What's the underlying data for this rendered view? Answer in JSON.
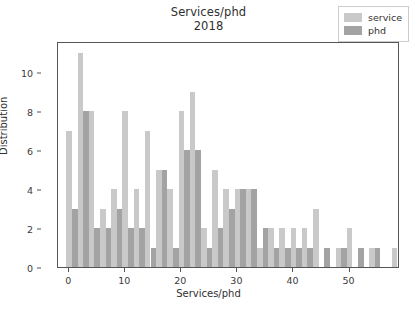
{
  "chart_data": {
    "type": "bar",
    "title": "Services/phd",
    "subtitle": "2018",
    "xlabel": "Services/phd",
    "ylabel": "Distribution",
    "xlim": [
      -2,
      59
    ],
    "ylim": [
      0,
      11.6
    ],
    "grid": false,
    "legend_position": "upper right",
    "xticks": [
      0,
      10,
      20,
      30,
      40,
      50
    ],
    "yticks": [
      0,
      2,
      4,
      6,
      8,
      10
    ],
    "colors": {
      "service": "#c9c9c9",
      "phd": "#a3a3a3",
      "axis": "#555555",
      "text": "#2f2f2f",
      "background": "#ffffff"
    },
    "series": [
      {
        "name": "service",
        "color": "#c9c9c9",
        "x": [
          0,
          2,
          4,
          6,
          9,
          11,
          13,
          15,
          17,
          19,
          21,
          23,
          25,
          27,
          29,
          31,
          33,
          35,
          37,
          39,
          41,
          44,
          47,
          50,
          52,
          56
        ],
        "values": [
          7,
          11,
          8,
          3,
          8,
          4,
          7,
          1,
          5,
          9,
          5,
          5,
          4,
          4,
          2,
          2,
          2,
          3,
          2,
          1,
          1,
          2,
          1,
          1,
          1,
          1
        ]
      },
      {
        "name": "phd",
        "color": "#a3a3a3",
        "x": [
          1,
          3,
          5,
          7,
          10,
          12,
          14,
          16,
          18,
          20,
          22,
          24,
          26,
          28,
          30,
          32,
          34,
          36,
          38,
          41,
          45,
          48,
          51,
          53
        ],
        "values": [
          3,
          2,
          2,
          3,
          2,
          1,
          1,
          5,
          6,
          2,
          2,
          3,
          4,
          4,
          1,
          1,
          1,
          1,
          1,
          1,
          1,
          1,
          1,
          1
        ]
      }
    ],
    "bars": [
      {
        "series": "service",
        "x": 0,
        "value": 7
      },
      {
        "series": "phd",
        "x": 1,
        "value": 3
      },
      {
        "series": "service",
        "x": 2,
        "value": 11
      },
      {
        "series": "phd",
        "x": 3,
        "value": 8
      },
      {
        "series": "service",
        "x": 4,
        "value": 8
      },
      {
        "series": "phd",
        "x": 5,
        "value": 2
      },
      {
        "series": "service",
        "x": 6,
        "value": 3
      },
      {
        "series": "phd",
        "x": 7,
        "value": 2
      },
      {
        "series": "service",
        "x": 8,
        "value": 4
      },
      {
        "series": "phd",
        "x": 9,
        "value": 3
      },
      {
        "series": "service",
        "x": 10,
        "value": 8
      },
      {
        "series": "phd",
        "x": 11,
        "value": 2
      },
      {
        "series": "service",
        "x": 12,
        "value": 4
      },
      {
        "series": "phd",
        "x": 13,
        "value": 2
      },
      {
        "series": "service",
        "x": 14,
        "value": 7
      },
      {
        "series": "phd",
        "x": 15,
        "value": 1
      },
      {
        "series": "service",
        "x": 16,
        "value": 5
      },
      {
        "series": "phd",
        "x": 17,
        "value": 5
      },
      {
        "series": "service",
        "x": 18,
        "value": 4
      },
      {
        "series": "phd",
        "x": 19,
        "value": 1
      },
      {
        "series": "service",
        "x": 20,
        "value": 8
      },
      {
        "series": "phd",
        "x": 21,
        "value": 6
      },
      {
        "series": "service",
        "x": 22,
        "value": 9
      },
      {
        "series": "phd",
        "x": 23,
        "value": 6
      },
      {
        "series": "service",
        "x": 24,
        "value": 2
      },
      {
        "series": "phd",
        "x": 25,
        "value": 1
      },
      {
        "series": "service",
        "x": 26,
        "value": 5
      },
      {
        "series": "phd",
        "x": 27,
        "value": 2
      },
      {
        "series": "service",
        "x": 28,
        "value": 4
      },
      {
        "series": "phd",
        "x": 29,
        "value": 3
      },
      {
        "series": "service",
        "x": 30,
        "value": 4
      },
      {
        "series": "phd",
        "x": 31,
        "value": 4
      },
      {
        "series": "service",
        "x": 32,
        "value": 4
      },
      {
        "series": "phd",
        "x": 33,
        "value": 4
      },
      {
        "series": "service",
        "x": 34,
        "value": 1
      },
      {
        "series": "phd",
        "x": 35,
        "value": 2
      },
      {
        "series": "service",
        "x": 36,
        "value": 2
      },
      {
        "series": "phd",
        "x": 37,
        "value": 1
      },
      {
        "series": "service",
        "x": 38,
        "value": 2
      },
      {
        "series": "phd",
        "x": 39,
        "value": 1
      },
      {
        "series": "service",
        "x": 40,
        "value": 2
      },
      {
        "series": "phd",
        "x": 41,
        "value": 1
      },
      {
        "series": "service",
        "x": 42,
        "value": 2
      },
      {
        "series": "phd",
        "x": 43,
        "value": 1
      },
      {
        "series": "service",
        "x": 44,
        "value": 3
      },
      {
        "series": "phd",
        "x": 46,
        "value": 1
      },
      {
        "series": "service",
        "x": 48,
        "value": 1
      },
      {
        "series": "phd",
        "x": 49,
        "value": 1
      },
      {
        "series": "service",
        "x": 50,
        "value": 2
      },
      {
        "series": "phd",
        "x": 52,
        "value": 1
      },
      {
        "series": "service",
        "x": 54,
        "value": 1
      },
      {
        "series": "phd",
        "x": 55,
        "value": 1
      },
      {
        "series": "service",
        "x": 58,
        "value": 1
      }
    ]
  },
  "legend": {
    "entries": [
      {
        "label": "service",
        "color": "#c9c9c9"
      },
      {
        "label": "phd",
        "color": "#a3a3a3"
      }
    ]
  }
}
